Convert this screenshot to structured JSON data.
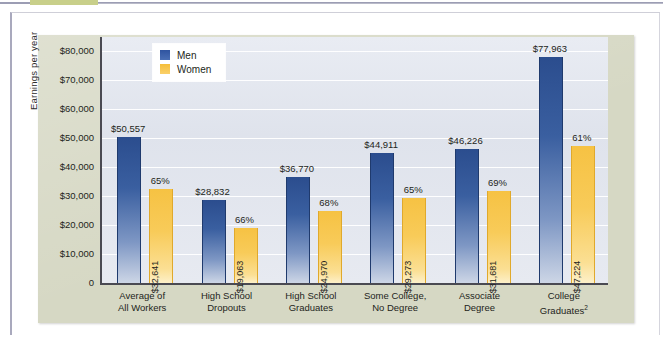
{
  "page": {
    "top_highlight_color": "#c8cf8a",
    "panel_color": "#d6d8c4",
    "plot_bg_color": "#e4e8f0"
  },
  "legend": {
    "position": "inside-top-left",
    "items": [
      {
        "label": "Men",
        "color": "#2f54a0"
      },
      {
        "label": "Women",
        "color": "#f5be38"
      }
    ]
  },
  "chart_data": {
    "type": "bar",
    "title": "",
    "subtitle": "",
    "xlabel": "",
    "ylabel": "Earnings per year",
    "ylim": [
      0,
      85000
    ],
    "grid": true,
    "legend_position": "inside-top-left",
    "categories": [
      "Average of\nAll Workers",
      "High School\nDropouts",
      "High School\nGraduates",
      "Some College,\nNo Degree",
      "Associate\nDegree",
      "College\nGraduates"
    ],
    "category_lines": [
      [
        "Average of",
        "All Workers"
      ],
      [
        "High School",
        "Dropouts"
      ],
      [
        "High School",
        "Graduates"
      ],
      [
        "Some College,",
        "No Degree"
      ],
      [
        "Associate",
        "Degree"
      ],
      [
        "College",
        "Graduates"
      ]
    ],
    "category_superscripts": [
      "",
      "",
      "",
      "",
      "",
      "2"
    ],
    "yticks": [
      0,
      10000,
      20000,
      30000,
      40000,
      50000,
      60000,
      70000,
      80000
    ],
    "ytick_labels": [
      "0",
      "$10,000",
      "$20,000",
      "$30,000",
      "$40,000",
      "$50,000",
      "$60,000",
      "$70,000",
      "$80,000"
    ],
    "series": [
      {
        "name": "Men",
        "color": "#2f54a0",
        "values": [
          50557,
          28832,
          36770,
          44911,
          46226,
          77963
        ],
        "labels": [
          "$50,557",
          "$28,832",
          "$36,770",
          "$44,911",
          "$46,226",
          "$77,963"
        ]
      },
      {
        "name": "Women",
        "color": "#f5be38",
        "values": [
          32641,
          19063,
          24970,
          29273,
          31681,
          47224
        ],
        "labels": [
          "$32,641",
          "$19,063",
          "$24,970",
          "$29,273",
          "$31,681",
          "$47,224"
        ],
        "ratio_labels": [
          "65%",
          "66%",
          "68%",
          "65%",
          "69%",
          "61%"
        ]
      }
    ]
  }
}
